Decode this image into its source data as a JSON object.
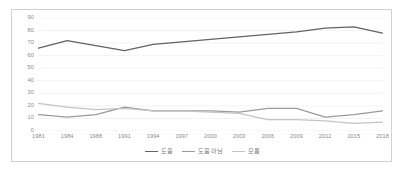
{
  "chart_data": {
    "type": "line",
    "title": "",
    "subtitle": "",
    "xlabel": "",
    "ylabel": "",
    "grid": true,
    "grid_axis": "y",
    "legend_position": "bottom",
    "ylim": [
      0,
      90
    ],
    "ytick_labels": [
      "90",
      "80",
      "70",
      "60",
      "50",
      "40",
      "30",
      "20",
      "10",
      "0"
    ],
    "yticks": [
      90,
      80,
      70,
      60,
      50,
      40,
      30,
      20,
      10,
      0
    ],
    "categories": [
      "1981",
      "1984",
      "1988",
      "1991",
      "1994",
      "1997",
      "2000",
      "2003",
      "2006",
      "2009",
      "2012",
      "2015",
      "2018"
    ],
    "series": [
      {
        "name": "도움",
        "color": "#636363",
        "values": [
          66,
          72,
          68,
          64,
          69,
          71,
          73,
          75,
          77,
          79,
          82,
          83,
          78
        ]
      },
      {
        "name": "도움 아님",
        "color": "#9a9a9a",
        "values": [
          13,
          11,
          13,
          19,
          16,
          16,
          16,
          15,
          18,
          18,
          11,
          13,
          16
        ]
      },
      {
        "name": "모름",
        "color": "#c4c4c4",
        "values": [
          22,
          19,
          17,
          18,
          16,
          16,
          15,
          14,
          9,
          9,
          8,
          6,
          7
        ]
      }
    ],
    "legend": [
      {
        "label": "도움",
        "color": "#636363"
      },
      {
        "label": "도움 아님",
        "color": "#9a9a9a"
      },
      {
        "label": "모름",
        "color": "#c4c4c4"
      }
    ],
    "colors": {
      "gridline": "#ededed",
      "frame": "#d2d2d2",
      "axis_text": "#8a8a8a",
      "legend_text": "#7d7d7d",
      "background": "#ffffff"
    }
  }
}
